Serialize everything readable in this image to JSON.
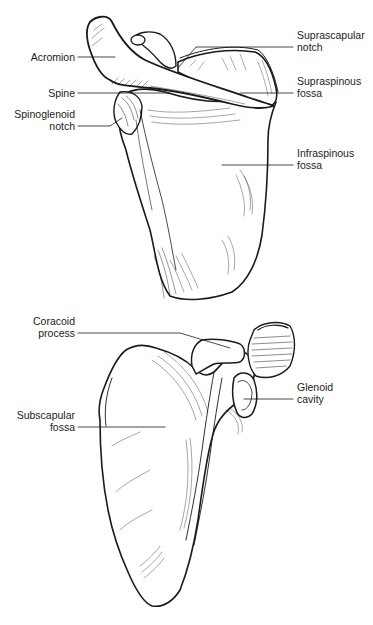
{
  "figure": {
    "top_view": {
      "name": "posterior-scapula",
      "labels": [
        {
          "id": "acromion",
          "lines": [
            "Acromion"
          ],
          "side": "left"
        },
        {
          "id": "spine",
          "lines": [
            "Spine"
          ],
          "side": "left"
        },
        {
          "id": "spinoglenoid-notch",
          "lines": [
            "Spinoglenoid",
            "notch"
          ],
          "side": "left"
        },
        {
          "id": "suprascapular-notch",
          "lines": [
            "Suprascapular",
            "notch"
          ],
          "side": "right"
        },
        {
          "id": "supraspinous-fossa",
          "lines": [
            "Supraspinous",
            "fossa"
          ],
          "side": "right"
        },
        {
          "id": "infraspinous-fossa",
          "lines": [
            "Infraspinous",
            "fossa"
          ],
          "side": "right"
        }
      ]
    },
    "bottom_view": {
      "name": "anterior-scapula",
      "labels": [
        {
          "id": "coracoid-process",
          "lines": [
            "Coracoid",
            "process"
          ],
          "side": "left"
        },
        {
          "id": "subscapular-fossa",
          "lines": [
            "Subscapular",
            "fossa"
          ],
          "side": "left"
        },
        {
          "id": "glenoid-cavity",
          "lines": [
            "Glenoid",
            "cavity"
          ],
          "side": "right"
        }
      ]
    },
    "colors": {
      "ink": "#1a1a1a",
      "background": "#ffffff"
    }
  }
}
